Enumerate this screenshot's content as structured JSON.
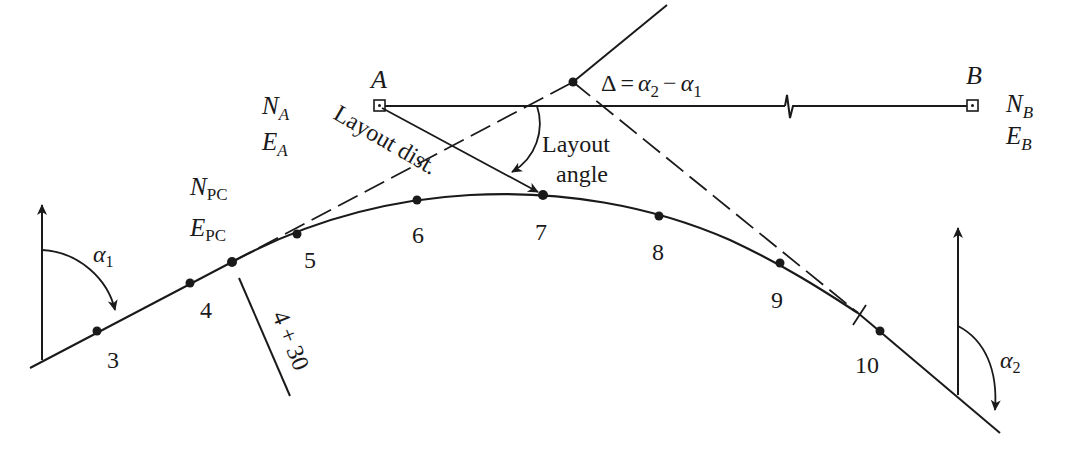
{
  "colors": {
    "ink": "#1a1a1a",
    "background": "#ffffff"
  },
  "points": {
    "A": {
      "label": "A",
      "north": "N",
      "north_sub": "A",
      "east": "E",
      "east_sub": "A"
    },
    "B": {
      "label": "B",
      "north": "N",
      "north_sub": "B",
      "east": "E",
      "east_sub": "B"
    },
    "PC": {
      "north": "N",
      "north_sub": "PC",
      "east": "E",
      "east_sub": "PC"
    }
  },
  "stations": [
    "3",
    "4",
    "5",
    "6",
    "7",
    "8",
    "9",
    "10"
  ],
  "pc_station_label": "4 + 30",
  "labels": {
    "delta_symbol": "Δ",
    "delta_eq": "=",
    "alpha": "α",
    "alpha2_sub": "2",
    "minus": "−",
    "alpha1_sub": "1",
    "layout_dist": "Layout dist.",
    "layout_angle_line1": "Layout",
    "layout_angle_line2": "angle",
    "alpha1": "α",
    "alpha1_subscript": "1",
    "alpha2": "α",
    "alpha2_subscript": "2"
  }
}
